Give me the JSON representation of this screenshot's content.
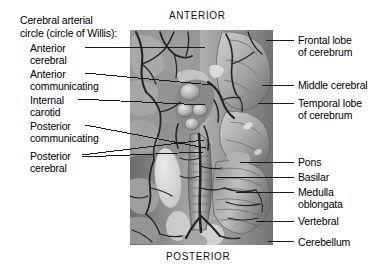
{
  "figure": {
    "title_block": {
      "line1": "Cerebral arterial",
      "line2": "circle (circle of Willis):"
    },
    "orientation": {
      "anterior": "ANTERIOR",
      "posterior": "POSTERIOR"
    },
    "left_labels": [
      {
        "id": "anterior-cerebral",
        "line1": "Anterior",
        "line2": "cerebral"
      },
      {
        "id": "anterior-communicating",
        "line1": "Anterior",
        "line2": "communicating"
      },
      {
        "id": "internal-carotid",
        "line1": "Internal",
        "line2": "carotid"
      },
      {
        "id": "posterior-communicating",
        "line1": "Posterior",
        "line2": "communicating"
      },
      {
        "id": "posterior-cerebral",
        "line1": "Posterior",
        "line2": "cerebral"
      }
    ],
    "right_labels": [
      {
        "id": "frontal-lobe",
        "line1": "Frontal lobe",
        "line2": "of cerebrum"
      },
      {
        "id": "middle-cerebral",
        "line1": "Middle cerebral",
        "line2": ""
      },
      {
        "id": "temporal-lobe",
        "line1": "Temporal lobe",
        "line2": "of cerebrum"
      },
      {
        "id": "pons",
        "line1": "Pons",
        "line2": ""
      },
      {
        "id": "basilar",
        "line1": "Basilar",
        "line2": ""
      },
      {
        "id": "medulla",
        "line1": "Medulla",
        "line2": "oblongata"
      },
      {
        "id": "vertebral",
        "line1": "Vertebral",
        "line2": ""
      },
      {
        "id": "cerebellum",
        "line1": "Cerebellum",
        "line2": ""
      }
    ],
    "colors": {
      "background": "#ffffff",
      "text": "#000000",
      "leader_line": "#1a1a1a",
      "plate_mid": "#8d8d8d",
      "plate_light": "#dedede",
      "plate_dark": "#3a3a3a",
      "vessel": "#2a2a2a"
    }
  }
}
